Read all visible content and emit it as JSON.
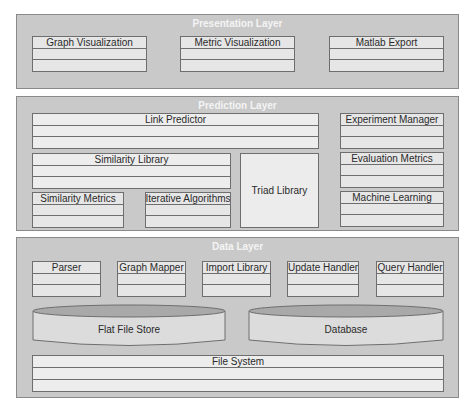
{
  "layers": {
    "presentation": {
      "title": "Presentation Layer",
      "components": [
        "Graph Visualization",
        "Metric Visualization",
        "Matlab Export"
      ]
    },
    "prediction": {
      "title": "Prediction Layer",
      "components": {
        "link_predictor": "Link Predictor",
        "experiment_manager": "Experiment Manager",
        "similarity_library": "Similarity Library",
        "evaluation_metrics": "Evaluation Metrics",
        "triad_library": "Triad Library",
        "similarity_metrics": "Similarity Metrics",
        "iterative_algorithms": "Iterative Algorithms",
        "machine_learning": "Machine Learning"
      }
    },
    "data": {
      "title": "Data Layer",
      "components": [
        "Parser",
        "Graph Mapper",
        "Import Library",
        "Update Handler",
        "Query Handler"
      ],
      "stores": [
        "Flat File Store",
        "Database"
      ],
      "file_system": "File System"
    }
  },
  "colors": {
    "layer_bg": "#c9c9c9",
    "component_bg": "#e6e6e6",
    "border": "#6e6e6e",
    "layer_title": "#f4f4f4",
    "cylinder_top": "#a9a9a9"
  }
}
